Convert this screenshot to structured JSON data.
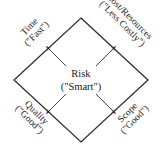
{
  "diagram": {
    "type": "risk-diamond",
    "shape": "diamond",
    "stroke_color": "#2b2b2b",
    "fill_color": "#ffffff",
    "arrow_color": "#3a3a3a",
    "center": {
      "name": "Risk",
      "line1": "Risk",
      "line2": "(\"Smart\")"
    },
    "vertices": [
      {
        "id": "time",
        "position": "top-left",
        "line1": "Time",
        "line2": "(\"Fast\")",
        "rotation_deg": -45
      },
      {
        "id": "cost-resources",
        "position": "top-right",
        "line1": "Cost/Resources",
        "line2": "(\"Less Costly\")",
        "rotation_deg": 45
      },
      {
        "id": "quality",
        "position": "bottom-left",
        "line1": "Quality",
        "line2": "(\"Good\")",
        "rotation_deg": 45
      },
      {
        "id": "scope",
        "position": "bottom-right",
        "line1": "Scope",
        "line2": "(\"Good\")",
        "rotation_deg": -45
      }
    ],
    "arrows": [
      {
        "id": "arrow-to-time",
        "from": "center",
        "to": "time",
        "direction": "up-left"
      },
      {
        "id": "arrow-to-cost",
        "from": "center",
        "to": "cost-resources",
        "direction": "up-right"
      },
      {
        "id": "arrow-to-quality",
        "from": "center",
        "to": "quality",
        "direction": "down-left"
      },
      {
        "id": "arrow-to-scope",
        "from": "center",
        "to": "scope",
        "direction": "down-right"
      }
    ]
  }
}
